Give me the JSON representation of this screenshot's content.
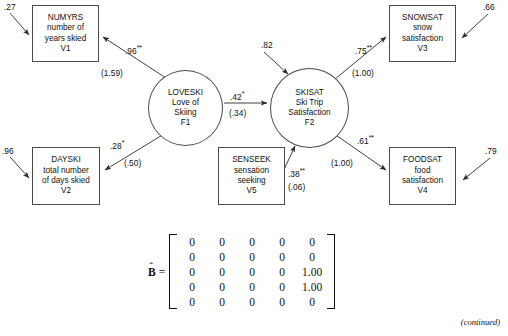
{
  "figure": {
    "type": "structural-equation-model-path-diagram",
    "footer_note": "(continued)"
  },
  "nodes": {
    "numyrs": {
      "id": "V1",
      "name": "NUMYRS",
      "desc_line1": "number of",
      "desc_line2": "years skied",
      "shape": "box",
      "x": 32,
      "y": 5,
      "w": 67,
      "h": 57
    },
    "dayski": {
      "id": "V2",
      "name": "DAYSKI",
      "desc_line1": "total number",
      "desc_line2": "of days skied",
      "shape": "box",
      "x": 32,
      "y": 147,
      "w": 68,
      "h": 58
    },
    "senseek": {
      "id": "V5",
      "name": "SENSEEK",
      "desc_line1": "sensation",
      "desc_line2": "seeking",
      "shape": "box",
      "x": 218,
      "y": 147,
      "w": 67,
      "h": 58
    },
    "snowsat": {
      "id": "V3",
      "name": "SNOWSAT",
      "desc_line1": "snow",
      "desc_line2": "satisfaction",
      "shape": "box",
      "x": 389,
      "y": 5,
      "w": 67,
      "h": 57
    },
    "foodsat": {
      "id": "V4",
      "name": "FOODSAT",
      "desc_line1": "food",
      "desc_line2": "satisfaction",
      "shape": "box",
      "x": 389,
      "y": 147,
      "w": 67,
      "h": 58
    },
    "loveski": {
      "id": "F1",
      "name": "LOVESKI",
      "desc_line1": "Love of",
      "desc_line2": "Skiing",
      "shape": "circle",
      "x": 148,
      "y": 70,
      "w": 75,
      "h": 76
    },
    "skisat": {
      "id": "F2",
      "name": "SKISAT",
      "desc_line1": "Ski Trip",
      "desc_line2": "Satisfaction",
      "shape": "circle",
      "x": 270,
      "y": 68,
      "w": 79,
      "h": 80
    }
  },
  "paths": [
    {
      "key": "loveski_to_numyrs",
      "from": "loveski",
      "to": "numyrs",
      "estimate": ".96",
      "stars": "**",
      "se": "(1.59)"
    },
    {
      "key": "loveski_to_dayski",
      "from": "loveski",
      "to": "dayski",
      "estimate": ".28",
      "stars": "*",
      "se": "(.50)"
    },
    {
      "key": "loveski_to_skisat",
      "from": "loveski",
      "to": "skisat",
      "estimate": ".42",
      "stars": "*",
      "se": "(.34)"
    },
    {
      "key": "senseek_to_skisat",
      "from": "senseek",
      "to": "skisat",
      "estimate": ".38",
      "stars": "**",
      "se": "(.06)"
    },
    {
      "key": "skisat_to_snowsat",
      "from": "skisat",
      "to": "snowsat",
      "estimate": ".75",
      "stars": "**",
      "se": "(1.00)"
    },
    {
      "key": "skisat_to_foodsat",
      "from": "skisat",
      "to": "foodsat",
      "estimate": ".61",
      "stars": "**",
      "se": "(1.00)"
    }
  ],
  "residuals": [
    {
      "key": "numyrs_residual",
      "target": "numyrs",
      "value": ".27"
    },
    {
      "key": "dayski_residual",
      "target": "dayski",
      "value": ".96"
    },
    {
      "key": "skisat_residual",
      "target": "skisat",
      "value": ".82"
    },
    {
      "key": "snowsat_residual",
      "target": "snowsat",
      "value": ".66"
    },
    {
      "key": "foodsat_residual",
      "target": "foodsat",
      "value": ".79"
    }
  ],
  "matrix": {
    "symbol": "B",
    "hat": "ˆ",
    "equals": "=",
    "rows": [
      [
        "0",
        "0",
        "0",
        "0",
        "0"
      ],
      [
        "0",
        "0",
        "0",
        "0",
        "0"
      ],
      [
        "0",
        "0",
        "0",
        "0",
        "1.00"
      ],
      [
        "0",
        "0",
        "0",
        "0",
        "1.00"
      ],
      [
        "0",
        "0",
        "0",
        "0",
        "0"
      ]
    ]
  },
  "colors": {
    "stroke": "#4a4a4a",
    "text": "#111111",
    "background": "#ffffff"
  }
}
